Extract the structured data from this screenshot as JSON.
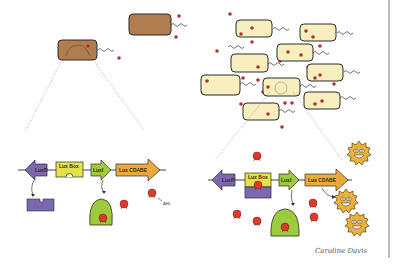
{
  "colors": {
    "low_density_cell": "#b07d4f",
    "high_density_cell": "#f7efc0",
    "autoinducer": "#c0392b",
    "luxR_gene": "#7b68b0",
    "luxbox": "#e4e24a",
    "luxI_gene": "#9ccb3c",
    "luxCDABE_gene": "#e9a93c",
    "luxR_protein": "#7b68b0",
    "luxI_enzyme": "#9ccb3c",
    "glowing_bacterium": "#eab23c",
    "outline": "#2b2b2b"
  },
  "left_panel": {
    "state": "low cell density",
    "genes": [
      {
        "id": "luxR",
        "label": "LuxR",
        "direction": "left"
      },
      {
        "id": "luxbox",
        "label": "Lux Box",
        "direction": "none"
      },
      {
        "id": "luxI",
        "label": "LuxI",
        "direction": "right"
      },
      {
        "id": "luxCDABE",
        "label": "Lux CDABE",
        "direction": "right"
      }
    ],
    "annotation": "AHL"
  },
  "right_panel": {
    "state": "high cell density",
    "genes": [
      {
        "id": "luxR",
        "label": "LuxR",
        "direction": "left"
      },
      {
        "id": "luxbox",
        "label": "Lux Box",
        "direction": "none"
      },
      {
        "id": "luxI",
        "label": "LuxI",
        "direction": "right"
      },
      {
        "id": "luxCDABE",
        "label": "Lux CDABE",
        "direction": "right"
      }
    ],
    "glowing_count": 3
  },
  "signature": "Caroline Davis"
}
